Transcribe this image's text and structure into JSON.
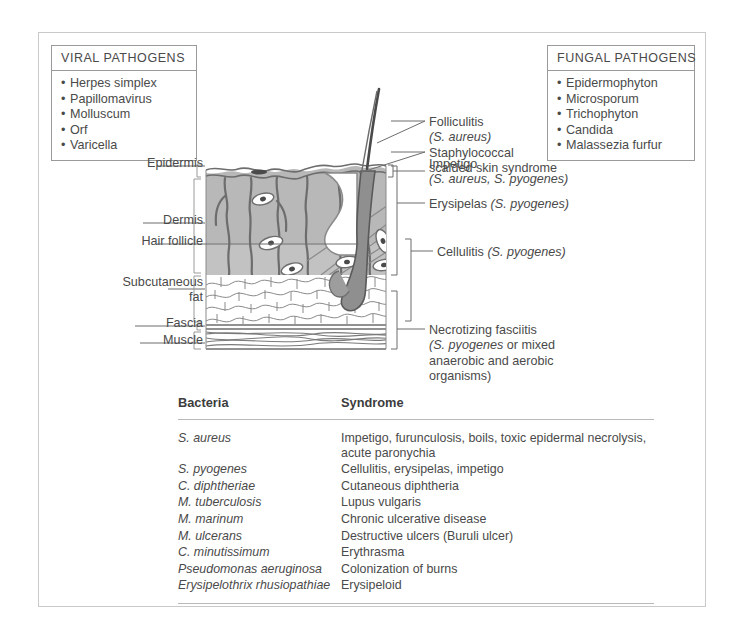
{
  "viral_box": {
    "heading": "VIRAL PATHOGENS",
    "items": [
      "Herpes simplex",
      "Papillomavirus",
      "Molluscum",
      "Orf",
      "Varicella"
    ]
  },
  "fungal_box": {
    "heading": "FUNGAL PATHOGENS",
    "items": [
      "Epidermophyton",
      "Microsporum",
      "Trichophyton",
      "Candida",
      "Malassezia furfur"
    ]
  },
  "anatomy_labels": {
    "epidermis": "Epidermis",
    "dermis": "Dermis",
    "hair_follicle": "Hair follicle",
    "subcutaneous_fat_line1": "Subcutaneous",
    "subcutaneous_fat_line2": "fat",
    "fascia": "Fascia",
    "muscle": "Muscle"
  },
  "condition_labels": {
    "folliculitis_name": "Folliculitis",
    "folliculitis_organism": "(S. aureus)",
    "ssss_line1": "Staphylococcal",
    "ssss_line2": "scalded skin syndrome",
    "impetigo_name": "Impetigo",
    "impetigo_organism": "(S. aureus, S. pyogenes)",
    "erysipelas_name": "Erysipelas ",
    "erysipelas_organism": "(S. pyogenes)",
    "cellulitis_name": "Cellulitis ",
    "cellulitis_organism": "(S. pyogenes)",
    "necfasc_name": "Necrotizing fasciitis",
    "necfasc_organism": "(S. pyogenes",
    "necfasc_rest": " or mixed anaerobic and aerobic organisms)"
  },
  "table": {
    "columns": [
      "Bacteria",
      "Syndrome"
    ],
    "rows": [
      {
        "bacteria": "S. aureus",
        "syndrome": "Impetigo, furunculosis, boils, toxic epidermal necrolysis, acute paronychia"
      },
      {
        "bacteria": "S. pyogenes",
        "syndrome": "Cellulitis, erysipelas, impetigo"
      },
      {
        "bacteria": "C. diphtheriae",
        "syndrome": "Cutaneous diphtheria"
      },
      {
        "bacteria": "M. tuberculosis",
        "syndrome": "Lupus vulgaris"
      },
      {
        "bacteria": "M. marinum",
        "syndrome": "Chronic ulcerative disease"
      },
      {
        "bacteria": "M. ulcerans",
        "syndrome": "Destructive ulcers (Buruli ulcer)"
      },
      {
        "bacteria": "C. minutissimum",
        "syndrome": "Erythrasma"
      },
      {
        "bacteria": "Pseudomonas aeruginosa",
        "syndrome": "Colonization of burns"
      },
      {
        "bacteria": "Erysipelothrix rhusiopathiae",
        "syndrome": "Erysipeloid"
      }
    ]
  },
  "colors": {
    "text": "#4a4a4a",
    "frame_border": "#c9c9c9",
    "box_border": "#9a9a9a",
    "rule": "#b9b9b9",
    "dermis_fill": "#b6b6b6",
    "dermis_fill_light": "#c4c4c4",
    "line": "#6d6d6d",
    "hair_dark": "#5a5a5a"
  }
}
